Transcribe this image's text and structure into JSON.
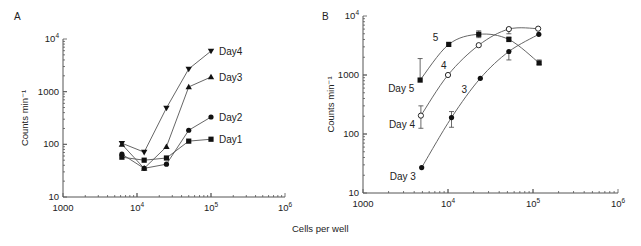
{
  "shared_xlabel": "Cells per well",
  "chart_data": [
    {
      "panel": "A",
      "type": "line",
      "title": "",
      "xlabel": "Cells per well",
      "ylabel": "Counts min⁻¹",
      "xscale": "log",
      "yscale": "log",
      "xlim": [
        1000,
        1000000
      ],
      "ylim": [
        10,
        10000
      ],
      "xticks": [
        {
          "value": 1000,
          "base": "1000",
          "exp": ""
        },
        {
          "value": 10000,
          "base": "10",
          "exp": "4"
        },
        {
          "value": 100000,
          "base": "10",
          "exp": "5"
        },
        {
          "value": 1000000,
          "base": "10",
          "exp": "6"
        }
      ],
      "yticks": [
        {
          "value": 10,
          "base": "10",
          "exp": ""
        },
        {
          "value": 100,
          "base": "100",
          "exp": ""
        },
        {
          "value": 1000,
          "base": "1000",
          "exp": ""
        },
        {
          "value": 10000,
          "base": "10",
          "exp": "4"
        }
      ],
      "x": [
        6250,
        12500,
        25000,
        50000,
        100000
      ],
      "series": [
        {
          "name": "Day4",
          "marker": "triangle-down",
          "values": [
            105,
            71,
            490,
            2700,
            5900
          ]
        },
        {
          "name": "Day3",
          "marker": "triangle-up",
          "values": [
            100,
            35,
            90,
            1230,
            1900
          ]
        },
        {
          "name": "Day2",
          "marker": "circle",
          "values": [
            65,
            35,
            42,
            185,
            330
          ]
        },
        {
          "name": "Day1",
          "marker": "square",
          "values": [
            57,
            50,
            55,
            115,
            125
          ]
        }
      ],
      "grid": false,
      "legend": "inline labels at line ends"
    },
    {
      "panel": "B",
      "type": "line",
      "title": "",
      "xlabel": "Cells per well",
      "ylabel": "Counts min⁻¹",
      "xscale": "log",
      "yscale": "log",
      "xlim": [
        1000,
        1000000
      ],
      "ylim": [
        10,
        10000
      ],
      "xticks": [
        {
          "value": 1000,
          "base": "1000",
          "exp": ""
        },
        {
          "value": 10000,
          "base": "10",
          "exp": "4"
        },
        {
          "value": 100000,
          "base": "10",
          "exp": "5"
        },
        {
          "value": 1000000,
          "base": "10",
          "exp": "6"
        }
      ],
      "yticks": [
        {
          "value": 10,
          "base": "10",
          "exp": ""
        },
        {
          "value": 100,
          "base": "100",
          "exp": ""
        },
        {
          "value": 1000,
          "base": "1000",
          "exp": ""
        },
        {
          "value": 10000,
          "base": "10",
          "exp": "4"
        }
      ],
      "series": [
        {
          "name": "Day 5",
          "curve_label": "5",
          "marker": "square",
          "x": [
            4700,
            10200,
            23000,
            52000,
            118000
          ],
          "values": [
            820,
            3300,
            4900,
            4000,
            1600
          ],
          "err_high": [
            1900,
            null,
            5600,
            4400,
            1800
          ],
          "err_low": [
            null,
            null,
            4300,
            null,
            1500
          ]
        },
        {
          "name": "Day 4",
          "curve_label": "4",
          "marker": "open-circle",
          "x": [
            4800,
            10000,
            23000,
            52000,
            115000
          ],
          "values": [
            205,
            1000,
            3200,
            6000,
            6100
          ],
          "err_high": [
            300,
            null,
            null,
            6200,
            null
          ],
          "err_low": [
            125,
            null,
            null,
            5000,
            null
          ]
        },
        {
          "name": "Day 3",
          "curve_label": "3",
          "marker": "circle",
          "x": [
            4900,
            11000,
            24000,
            52000,
            117000
          ],
          "values": [
            27,
            190,
            880,
            2500,
            4900
          ],
          "err_high": [
            null,
            240,
            null,
            null,
            null
          ],
          "err_low": [
            null,
            130,
            null,
            1800,
            null
          ]
        }
      ],
      "grid": false,
      "legend": "inline labels at line starts"
    }
  ]
}
